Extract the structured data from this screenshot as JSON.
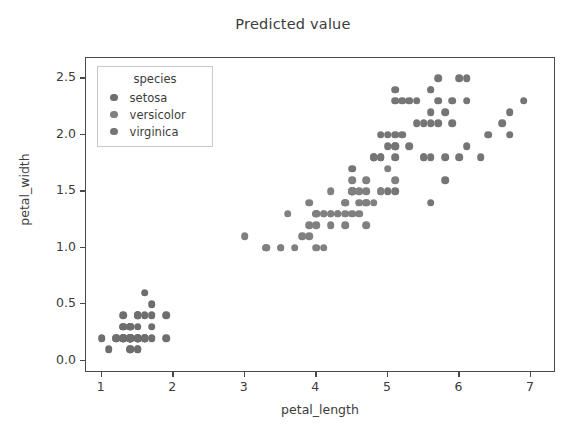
{
  "chart_data": {
    "type": "scatter",
    "title": "Predicted value",
    "xlabel": "petal_length",
    "ylabel": "petal_width",
    "xlim": [
      0.78,
      7.35
    ],
    "ylim": [
      -0.11,
      2.68
    ],
    "xticks": [
      1,
      2,
      3,
      4,
      5,
      6,
      7
    ],
    "xtick_labels": [
      "1",
      "2",
      "3",
      "4",
      "5",
      "6",
      "7"
    ],
    "yticks": [
      0.0,
      0.5,
      1.0,
      1.5,
      2.0,
      2.5
    ],
    "ytick_labels": [
      "0.0",
      "0.5",
      "1.0",
      "1.5",
      "2.0",
      "2.5"
    ],
    "grid": false,
    "marker_color": "#6e6e6e",
    "marker_size": 7.6,
    "legend": {
      "position": "upper left",
      "title": "species",
      "entries": [
        {
          "label": "setosa",
          "color": "#6e6e6e"
        },
        {
          "label": "versicolor",
          "color": "#808080"
        },
        {
          "label": "virginica",
          "color": "#757575"
        }
      ]
    },
    "series": [
      {
        "name": "setosa",
        "color": "#6e6e6e",
        "points": [
          [
            1.4,
            0.2
          ],
          [
            1.4,
            0.2
          ],
          [
            1.3,
            0.2
          ],
          [
            1.5,
            0.2
          ],
          [
            1.4,
            0.2
          ],
          [
            1.7,
            0.4
          ],
          [
            1.4,
            0.3
          ],
          [
            1.5,
            0.2
          ],
          [
            1.4,
            0.2
          ],
          [
            1.5,
            0.1
          ],
          [
            1.5,
            0.2
          ],
          [
            1.6,
            0.2
          ],
          [
            1.4,
            0.1
          ],
          [
            1.1,
            0.1
          ],
          [
            1.2,
            0.2
          ],
          [
            1.5,
            0.4
          ],
          [
            1.3,
            0.4
          ],
          [
            1.4,
            0.3
          ],
          [
            1.7,
            0.3
          ],
          [
            1.5,
            0.3
          ],
          [
            1.7,
            0.2
          ],
          [
            1.5,
            0.4
          ],
          [
            1.0,
            0.2
          ],
          [
            1.7,
            0.5
          ],
          [
            1.9,
            0.2
          ],
          [
            1.6,
            0.2
          ],
          [
            1.6,
            0.4
          ],
          [
            1.5,
            0.2
          ],
          [
            1.4,
            0.2
          ],
          [
            1.6,
            0.2
          ],
          [
            1.6,
            0.2
          ],
          [
            1.5,
            0.4
          ],
          [
            1.5,
            0.1
          ],
          [
            1.4,
            0.2
          ],
          [
            1.5,
            0.2
          ],
          [
            1.2,
            0.2
          ],
          [
            1.3,
            0.2
          ],
          [
            1.4,
            0.1
          ],
          [
            1.3,
            0.2
          ],
          [
            1.5,
            0.2
          ],
          [
            1.3,
            0.3
          ],
          [
            1.3,
            0.3
          ],
          [
            1.3,
            0.2
          ],
          [
            1.6,
            0.6
          ],
          [
            1.9,
            0.4
          ],
          [
            1.4,
            0.3
          ],
          [
            1.6,
            0.2
          ],
          [
            1.4,
            0.2
          ],
          [
            1.5,
            0.2
          ],
          [
            1.4,
            0.2
          ]
        ]
      },
      {
        "name": "versicolor",
        "color": "#808080",
        "points": [
          [
            4.7,
            1.4
          ],
          [
            4.5,
            1.5
          ],
          [
            4.9,
            1.5
          ],
          [
            4.0,
            1.3
          ],
          [
            4.6,
            1.5
          ],
          [
            4.5,
            1.3
          ],
          [
            4.7,
            1.6
          ],
          [
            3.3,
            1.0
          ],
          [
            4.6,
            1.3
          ],
          [
            3.9,
            1.4
          ],
          [
            3.5,
            1.0
          ],
          [
            4.2,
            1.5
          ],
          [
            4.0,
            1.0
          ],
          [
            4.7,
            1.4
          ],
          [
            3.6,
            1.3
          ],
          [
            4.4,
            1.4
          ],
          [
            4.5,
            1.5
          ],
          [
            4.1,
            1.0
          ],
          [
            4.5,
            1.5
          ],
          [
            3.9,
            1.1
          ],
          [
            4.8,
            1.8
          ],
          [
            4.0,
            1.3
          ],
          [
            4.9,
            1.5
          ],
          [
            4.7,
            1.2
          ],
          [
            4.3,
            1.3
          ],
          [
            4.4,
            1.4
          ],
          [
            4.8,
            1.4
          ],
          [
            5.0,
            1.7
          ],
          [
            4.5,
            1.5
          ],
          [
            3.5,
            1.0
          ],
          [
            3.8,
            1.1
          ],
          [
            3.7,
            1.0
          ],
          [
            3.9,
            1.2
          ],
          [
            5.1,
            1.6
          ],
          [
            4.5,
            1.5
          ],
          [
            4.5,
            1.6
          ],
          [
            4.7,
            1.5
          ],
          [
            4.4,
            1.3
          ],
          [
            4.1,
            1.3
          ],
          [
            4.0,
            1.3
          ],
          [
            4.4,
            1.2
          ],
          [
            4.6,
            1.4
          ],
          [
            4.0,
            1.2
          ],
          [
            3.3,
            1.0
          ],
          [
            4.2,
            1.3
          ],
          [
            4.2,
            1.2
          ],
          [
            4.2,
            1.3
          ],
          [
            4.3,
            1.3
          ],
          [
            3.0,
            1.1
          ],
          [
            4.1,
            1.3
          ]
        ]
      },
      {
        "name": "virginica",
        "color": "#757575",
        "points": [
          [
            6.0,
            2.5
          ],
          [
            5.1,
            1.9
          ],
          [
            5.9,
            2.1
          ],
          [
            5.6,
            1.8
          ],
          [
            5.8,
            2.2
          ],
          [
            6.6,
            2.1
          ],
          [
            4.5,
            1.7
          ],
          [
            6.3,
            1.8
          ],
          [
            5.8,
            1.8
          ],
          [
            6.1,
            2.5
          ],
          [
            5.1,
            2.0
          ],
          [
            5.3,
            1.9
          ],
          [
            5.5,
            2.1
          ],
          [
            5.0,
            2.0
          ],
          [
            5.1,
            2.4
          ],
          [
            5.3,
            2.3
          ],
          [
            5.5,
            1.8
          ],
          [
            6.7,
            2.2
          ],
          [
            6.9,
            2.3
          ],
          [
            5.0,
            1.5
          ],
          [
            5.7,
            2.3
          ],
          [
            4.9,
            2.0
          ],
          [
            6.7,
            2.0
          ],
          [
            4.9,
            1.8
          ],
          [
            5.7,
            2.1
          ],
          [
            6.0,
            1.8
          ],
          [
            4.8,
            1.8
          ],
          [
            4.9,
            1.8
          ],
          [
            5.6,
            2.1
          ],
          [
            5.8,
            1.6
          ],
          [
            6.1,
            1.9
          ],
          [
            6.4,
            2.0
          ],
          [
            5.6,
            2.2
          ],
          [
            5.1,
            1.5
          ],
          [
            5.6,
            1.4
          ],
          [
            6.1,
            2.3
          ],
          [
            5.6,
            2.4
          ],
          [
            5.5,
            1.8
          ],
          [
            4.8,
            1.8
          ],
          [
            5.4,
            2.1
          ],
          [
            5.6,
            2.4
          ],
          [
            5.1,
            2.3
          ],
          [
            5.1,
            1.9
          ],
          [
            5.9,
            2.3
          ],
          [
            5.7,
            2.5
          ],
          [
            5.2,
            2.3
          ],
          [
            5.0,
            1.9
          ],
          [
            5.2,
            2.0
          ],
          [
            5.4,
            2.3
          ],
          [
            5.1,
            1.8
          ]
        ]
      }
    ]
  }
}
